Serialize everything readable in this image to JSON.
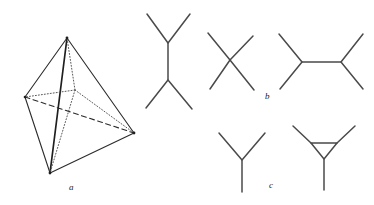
{
  "figure": {
    "background_color": "#ffffff",
    "stroke_color": "#2b2b2b",
    "panel_labels": [
      {
        "id": "a",
        "text": "a",
        "x": 69,
        "y": 183,
        "describes": "tetrahedron"
      },
      {
        "id": "b",
        "text": "b",
        "x": 265,
        "y": 92,
        "describes": "skeletal-formulas-row-1"
      },
      {
        "id": "c",
        "text": "c",
        "x": 269,
        "y": 181,
        "describes": "skeletal-formulas-row-2"
      }
    ]
  },
  "chart_data": {
    "type": "diagram",
    "xlabel": "",
    "ylabel": "",
    "panels": [
      {
        "label": "a",
        "name": "tetrahedron",
        "description": "Tetrahedron in perspective with central vertex connected by dotted bonds",
        "vertices": [
          {
            "name": "apex",
            "x": 67,
            "y": 38
          },
          {
            "name": "left",
            "x": 25,
            "y": 97
          },
          {
            "name": "right",
            "x": 134,
            "y": 133
          },
          {
            "name": "bottom",
            "x": 50,
            "y": 173
          },
          {
            "name": "center",
            "x": 75,
            "y": 90
          }
        ],
        "edges": [
          {
            "from": "apex",
            "to": "left",
            "style": "solid"
          },
          {
            "from": "apex",
            "to": "right",
            "style": "solid"
          },
          {
            "from": "apex",
            "to": "bottom",
            "style": "solid-bold"
          },
          {
            "from": "left",
            "to": "bottom",
            "style": "solid"
          },
          {
            "from": "right",
            "to": "bottom",
            "style": "solid"
          },
          {
            "from": "left",
            "to": "right",
            "style": "dashed"
          },
          {
            "from": "center",
            "to": "apex",
            "style": "dotted"
          },
          {
            "from": "center",
            "to": "left",
            "style": "dotted"
          },
          {
            "from": "center",
            "to": "right",
            "style": "dotted"
          },
          {
            "from": "center",
            "to": "bottom",
            "style": "dotted"
          }
        ]
      },
      {
        "label": "b",
        "name": "skeletal-formulas-row-1",
        "structures": [
          {
            "name": "n-hexane",
            "polyline": [
              [
                147,
                14
              ],
              [
                168,
                43
              ],
              [
                190,
                14
              ],
              [
                168,
                43
              ],
              [
                168,
                80
              ],
              [
                146,
                108
              ],
              [
                168,
                80
              ],
              [
                192,
                109
              ]
            ]
          },
          {
            "name": "neopentane",
            "center": [
              230,
              60
            ],
            "bonds": [
              [
                208,
                33
              ],
              [
                253,
                36
              ],
              [
                210,
                89
              ],
              [
                254,
                90
              ]
            ]
          },
          {
            "name": "dimethylbutane",
            "polyline": [
              [
                279,
                34
              ],
              [
                302,
                62
              ],
              [
                280,
                89
              ],
              [
                302,
                62
              ],
              [
                341,
                62
              ],
              [
                363,
                34
              ],
              [
                341,
                62
              ],
              [
                363,
                89
              ]
            ]
          }
        ]
      },
      {
        "label": "c",
        "name": "skeletal-formulas-row-2",
        "structures": [
          {
            "name": "isobutane",
            "center": [
              242,
              160
            ],
            "bonds": [
              [
                219,
                133
              ],
              [
                265,
                133
              ],
              [
                242,
                192
              ]
            ]
          },
          {
            "name": "cyclopropane-substituted",
            "ring": [
              [
                311,
                143
              ],
              [
                337,
                143
              ],
              [
                324,
                159
              ]
            ],
            "substituents": [
              {
                "from": [
                  311,
                  143
                ],
                "to": [
                  293,
                  126
                ]
              },
              {
                "from": [
                  337,
                  143
                ],
                "to": [
                  355,
                  126
                ]
              },
              {
                "from": [
                  324,
                  159
                ],
                "to": [
                  324,
                  190
                ]
              }
            ]
          }
        ]
      }
    ]
  }
}
